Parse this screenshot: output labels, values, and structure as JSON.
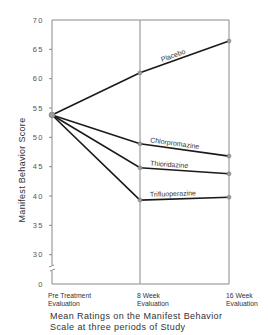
{
  "chart_data": {
    "type": "line",
    "caption_lines": [
      "Mean Ratings on the Manifest Behavior",
      "Scale at three periods of Study"
    ],
    "xlabel": "",
    "ylabel": "Manifest Behavior Score",
    "categories": [
      "Pre Treatment Evaluation",
      "8 Week Evaluation",
      "16 Week Evaluation"
    ],
    "category_lines": [
      [
        "Pre Treatment",
        "Evaluation"
      ],
      [
        "8 Week",
        "Evaluation"
      ],
      [
        "16 Week",
        "Evaluation"
      ]
    ],
    "yticks": [
      "0",
      "30",
      "35",
      "40",
      "45",
      "50",
      "55",
      "60",
      "65",
      "70"
    ],
    "ytick_values": [
      0,
      30,
      35,
      40,
      45,
      50,
      55,
      60,
      65,
      70
    ],
    "ylim": [
      0,
      70
    ],
    "axis_break": "between 0 and 30",
    "grid": false,
    "legend": "inline labels on lines",
    "series": [
      {
        "name": "Placebo",
        "values": [
          53.8,
          61.0,
          66.4
        ]
      },
      {
        "name": "Chlorpromazine",
        "values": [
          53.8,
          48.9,
          46.8
        ]
      },
      {
        "name": "Thioridazine",
        "values": [
          53.8,
          44.8,
          43.8
        ]
      },
      {
        "name": "Trifluoperazine",
        "values": [
          53.8,
          39.3,
          39.8
        ]
      }
    ]
  },
  "colors": {
    "line": "#1a1a1a",
    "axis": "#8a8a8a",
    "marker": "#9a9a9a",
    "text": "#333333"
  }
}
